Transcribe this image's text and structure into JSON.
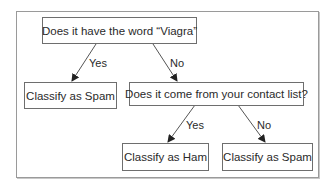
{
  "diagram": {
    "type": "decision-tree",
    "nodes": {
      "root": {
        "text": "Does it have the word “Viagra”"
      },
      "spam_left": {
        "text": "Classify as Spam"
      },
      "contact": {
        "text": "Does it come from your contact list?"
      },
      "ham": {
        "text": "Classify as Ham"
      },
      "spam_right": {
        "text": "Classify as Spam"
      }
    },
    "edges": [
      {
        "from": "root",
        "to": "spam_left",
        "label": "Yes"
      },
      {
        "from": "root",
        "to": "contact",
        "label": "No"
      },
      {
        "from": "contact",
        "to": "ham",
        "label": "Yes"
      },
      {
        "from": "contact",
        "to": "spam_right",
        "label": "No"
      }
    ],
    "colors": {
      "line": "#555555",
      "border": "#6e6e6e",
      "frame": "#9a9a9a"
    }
  }
}
